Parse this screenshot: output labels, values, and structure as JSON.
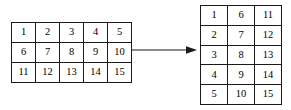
{
  "figure": {
    "background_color": "#ffffff",
    "border_color": "#1a1a1a",
    "text_color": "#000000"
  },
  "source_matrix": {
    "name": "source-matrix",
    "rows": 3,
    "cols": 5,
    "order": "row-major",
    "cells": [
      [
        "1",
        "2",
        "3",
        "4",
        "5"
      ],
      [
        "6",
        "7",
        "8",
        "9",
        "10"
      ],
      [
        "11",
        "12",
        "13",
        "14",
        "15"
      ]
    ]
  },
  "result_matrix": {
    "name": "result-matrix",
    "rows": 5,
    "cols": 3,
    "order": "column-major",
    "cells": [
      [
        "1",
        "6",
        "11"
      ],
      [
        "2",
        "7",
        "12"
      ],
      [
        "3",
        "8",
        "13"
      ],
      [
        "4",
        "9",
        "14"
      ],
      [
        "5",
        "10",
        "15"
      ]
    ]
  },
  "arrow": {
    "name": "transform-arrow",
    "direction": "right",
    "label": "",
    "color": "#1a1a1a"
  }
}
